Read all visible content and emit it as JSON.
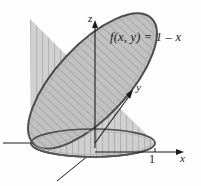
{
  "figure": {
    "type": "3d-solid-diagram",
    "background_color": "#fefefe",
    "surface_fill": "#c0c0c0",
    "cylinder_fill": "#cccccc",
    "outline_color": "#4a4a4a",
    "hatch_color": "#9a9a9a",
    "axis_color": "#1a1a1a"
  },
  "labels": {
    "z_axis": "z",
    "y_axis": "y",
    "x_axis": "x",
    "x_tick": "1",
    "function": "f(x, y) = 1 – x"
  },
  "axes": [
    {
      "name": "z",
      "label": "z",
      "direction": "up"
    },
    {
      "name": "y",
      "label": "y",
      "direction": "up-right"
    },
    {
      "name": "x",
      "label": "x",
      "direction": "right"
    }
  ],
  "ticks": [
    {
      "axis": "x",
      "value": "1"
    }
  ]
}
